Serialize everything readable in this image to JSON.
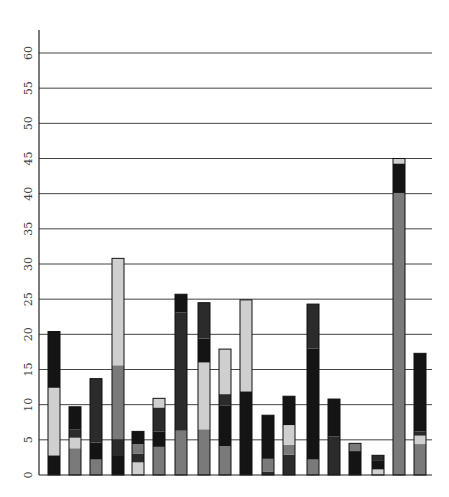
{
  "chart_data": {
    "type": "bar",
    "stacked": true,
    "title": "",
    "xlabel": "",
    "ylabel": "",
    "ylim": [
      0,
      60
    ],
    "yticks": [
      0,
      5,
      10,
      15,
      20,
      25,
      30,
      35,
      40,
      45,
      50,
      55,
      60
    ],
    "grid": true,
    "legend": "none",
    "categories": [
      "1",
      "2",
      "3",
      "4",
      "5",
      "6",
      "7",
      "8",
      "9",
      "10",
      "11",
      "12",
      "13",
      "14",
      "15",
      "16",
      "17",
      "18"
    ],
    "colors": {
      "black": "#141414",
      "dark": "#2b2b2b",
      "gray": "#7a7a7a",
      "light": "#cfcfcf"
    },
    "bars": [
      [
        {
          "c": "black",
          "v": 2.8
        },
        {
          "c": "light",
          "v": 9.6
        },
        {
          "c": "black",
          "v": 8.0
        }
      ],
      [
        {
          "c": "gray",
          "v": 3.8
        },
        {
          "c": "light",
          "v": 1.5
        },
        {
          "c": "dark",
          "v": 1.2
        },
        {
          "c": "black",
          "v": 3.2
        }
      ],
      [
        {
          "c": "gray",
          "v": 2.2
        },
        {
          "c": "black",
          "v": 2.4
        },
        {
          "c": "dark",
          "v": 9.1
        }
      ],
      [
        {
          "c": "black",
          "v": 2.7
        },
        {
          "c": "dark",
          "v": 2.4
        },
        {
          "c": "gray",
          "v": 10.5
        },
        {
          "c": "light",
          "v": 15.2
        }
      ],
      [
        {
          "c": "light",
          "v": 1.8
        },
        {
          "c": "dark",
          "v": 1.2
        },
        {
          "c": "gray",
          "v": 1.4
        },
        {
          "c": "black",
          "v": 1.8
        }
      ],
      [
        {
          "c": "gray",
          "v": 4.0
        },
        {
          "c": "black",
          "v": 2.2
        },
        {
          "c": "dark",
          "v": 3.4
        },
        {
          "c": "light",
          "v": 1.3
        }
      ],
      [
        {
          "c": "gray",
          "v": 6.3
        },
        {
          "c": "dark",
          "v": 16.8
        },
        {
          "c": "black",
          "v": 2.6
        }
      ],
      [
        {
          "c": "gray",
          "v": 6.5
        },
        {
          "c": "light",
          "v": 9.5
        },
        {
          "c": "black",
          "v": 3.4
        },
        {
          "c": "dark",
          "v": 5.1
        }
      ],
      [
        {
          "c": "gray",
          "v": 4.1
        },
        {
          "c": "black",
          "v": 5.8
        },
        {
          "c": "dark",
          "v": 1.6
        },
        {
          "c": "light",
          "v": 6.4
        }
      ],
      [
        {
          "c": "black",
          "v": 11.9
        },
        {
          "c": "light",
          "v": 13.0
        }
      ],
      [
        {
          "c": "dark",
          "v": 0.5
        },
        {
          "c": "gray",
          "v": 1.8
        },
        {
          "c": "black",
          "v": 6.2
        }
      ],
      [
        {
          "c": "dark",
          "v": 2.9
        },
        {
          "c": "gray",
          "v": 1.4
        },
        {
          "c": "light",
          "v": 2.8
        },
        {
          "c": "black",
          "v": 4.1
        }
      ],
      [
        {
          "c": "gray",
          "v": 2.2
        },
        {
          "c": "black",
          "v": 15.8
        },
        {
          "c": "dark",
          "v": 6.3
        }
      ],
      [
        {
          "c": "dark",
          "v": 5.5
        },
        {
          "c": "black",
          "v": 5.3
        }
      ],
      [
        {
          "c": "black",
          "v": 3.4
        },
        {
          "c": "gray",
          "v": 1.1
        }
      ],
      [
        {
          "c": "light",
          "v": 0.8
        },
        {
          "c": "black",
          "v": 1.2
        },
        {
          "c": "dark",
          "v": 0.8
        }
      ],
      [
        {
          "c": "gray",
          "v": 40.1
        },
        {
          "c": "black",
          "v": 4.2
        },
        {
          "c": "light",
          "v": 0.7
        }
      ],
      [
        {
          "c": "gray",
          "v": 4.4
        },
        {
          "c": "light",
          "v": 1.2
        },
        {
          "c": "dark",
          "v": 0.6
        },
        {
          "c": "black",
          "v": 11.1
        }
      ]
    ],
    "totals": [
      20.4,
      9.7,
      13.7,
      30.8,
      6.2,
      10.9,
      25.7,
      24.5,
      17.9,
      24.9,
      8.5,
      11.2,
      24.3,
      10.8,
      4.5,
      2.8,
      45.0,
      17.3
    ]
  }
}
